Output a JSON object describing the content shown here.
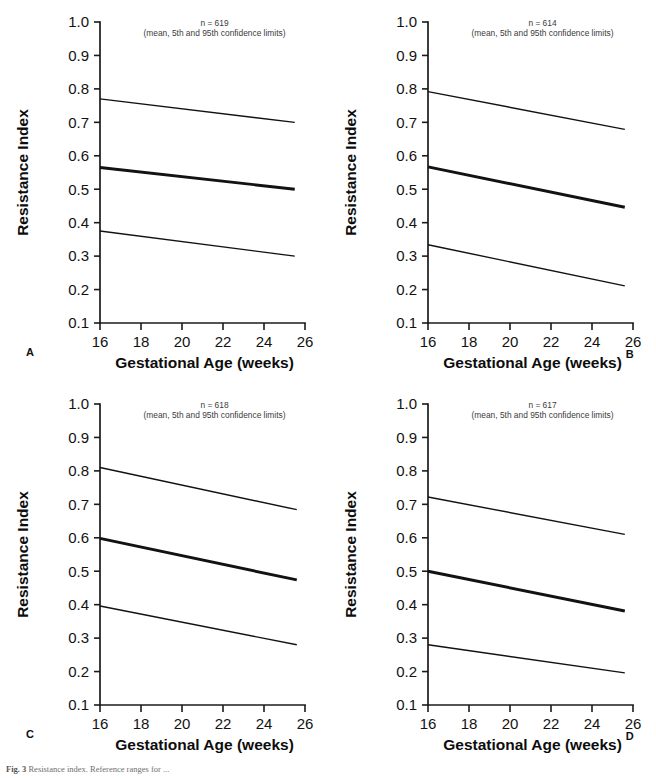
{
  "figure": {
    "caption_prefix": "Fig. 3",
    "caption_text": "Resistance index. Reference ranges for ...",
    "panel_letters": [
      "A",
      "B",
      "C",
      "D"
    ]
  },
  "axes": {
    "xlabel": "Gestational Age (weeks)",
    "ylabel": "Resistance Index",
    "xticks": [
      16,
      18,
      20,
      22,
      24,
      26
    ],
    "xtick_labels": [
      "16",
      "18",
      "20",
      "22",
      "24",
      "26"
    ],
    "yticks": [
      0.1,
      0.2,
      0.3,
      0.4,
      0.5,
      0.6,
      0.7,
      0.8,
      0.9,
      1.0
    ],
    "ytick_labels": [
      "0.1",
      "0.2",
      "0.3",
      "0.4",
      "0.5",
      "0.6",
      "0.7",
      "0.8",
      "0.9",
      "1.0"
    ],
    "xlim": [
      16,
      26
    ],
    "ylim": [
      0.1,
      1.0
    ],
    "grid": false,
    "legend": "none"
  },
  "annotation_line2": "(mean, 5th and 95th confidence limits)",
  "chart_data": [
    {
      "type": "line",
      "panel": "A",
      "title": "",
      "xlabel": "Gestational Age (weeks)",
      "ylabel": "Resistance Index",
      "xlim": [
        16,
        26
      ],
      "ylim": [
        0.1,
        1.0
      ],
      "grid": false,
      "n_label": "n = 619",
      "annotation": "(mean, 5th and 95th confidence limits)",
      "x": [
        16,
        25.5
      ],
      "series": [
        {
          "name": "95th confidence limit",
          "values": [
            0.77,
            0.7
          ],
          "style": "thin"
        },
        {
          "name": "mean",
          "values": [
            0.565,
            0.5
          ],
          "style": "thick"
        },
        {
          "name": "5th confidence limit",
          "values": [
            0.375,
            0.3
          ],
          "style": "thin"
        }
      ]
    },
    {
      "type": "line",
      "panel": "B",
      "title": "",
      "xlabel": "Gestational Age (weeks)",
      "ylabel": "Resistance Index",
      "xlim": [
        16,
        26
      ],
      "ylim": [
        0.1,
        1.0
      ],
      "grid": false,
      "n_label": "n = 614",
      "annotation": "(mean, 5th and 95th confidence limits)",
      "x": [
        16,
        25.6
      ],
      "series": [
        {
          "name": "95th confidence limit",
          "values": [
            0.792,
            0.679
          ],
          "style": "thin"
        },
        {
          "name": "mean",
          "values": [
            0.567,
            0.446
          ],
          "style": "thick"
        },
        {
          "name": "5th confidence limit",
          "values": [
            0.334,
            0.211
          ],
          "style": "thin"
        }
      ]
    },
    {
      "type": "line",
      "panel": "C",
      "title": "",
      "xlabel": "Gestational Age (weeks)",
      "ylabel": "Resistance Index",
      "xlim": [
        16,
        26
      ],
      "ylim": [
        0.1,
        1.0
      ],
      "grid": false,
      "n_label": "n = 618",
      "annotation": "(mean, 5th and 95th confidence limits)",
      "x": [
        16,
        25.6
      ],
      "series": [
        {
          "name": "95th confidence limit",
          "values": [
            0.81,
            0.684
          ],
          "style": "thin"
        },
        {
          "name": "mean",
          "values": [
            0.598,
            0.474
          ],
          "style": "thick"
        },
        {
          "name": "5th confidence limit",
          "values": [
            0.396,
            0.28
          ],
          "style": "thin"
        }
      ]
    },
    {
      "type": "line",
      "panel": "D",
      "title": "",
      "xlabel": "Gestational Age (weeks)",
      "ylabel": "Resistance Index",
      "xlim": [
        16,
        26
      ],
      "ylim": [
        0.1,
        1.0
      ],
      "grid": false,
      "n_label": "n = 617",
      "annotation": "(mean, 5th and 95th confidence limits)",
      "x": [
        16,
        25.6
      ],
      "series": [
        {
          "name": "95th confidence limit",
          "values": [
            0.722,
            0.61
          ],
          "style": "thin"
        },
        {
          "name": "mean",
          "values": [
            0.5,
            0.381
          ],
          "style": "thick"
        },
        {
          "name": "5th confidence limit",
          "values": [
            0.28,
            0.196
          ],
          "style": "thin"
        }
      ]
    }
  ]
}
